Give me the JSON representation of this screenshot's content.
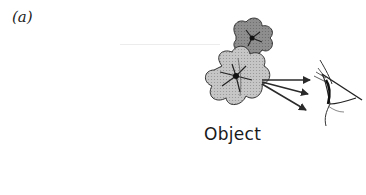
{
  "figure": {
    "panel_label": "(a)",
    "object_label": "Object",
    "elements": {
      "flowers": "two-flower-illustration",
      "light_rays": 3,
      "observer": "eye-icon"
    },
    "colors": {
      "back_flower_fill": "#8e8e8e",
      "front_flower_fill": "#c4c4c4",
      "outline": "#333333",
      "arrow": "#2a2a2a"
    }
  }
}
